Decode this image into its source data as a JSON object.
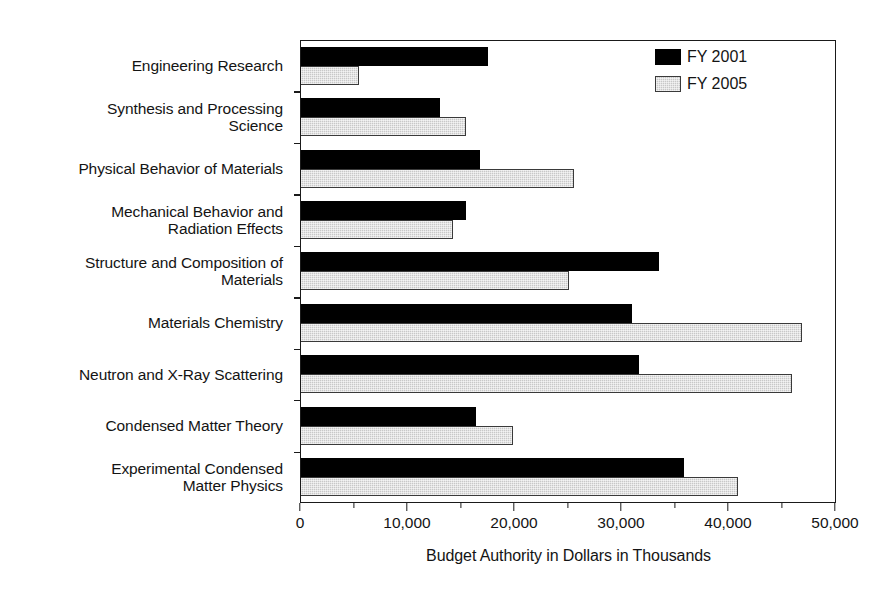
{
  "chart_data": {
    "type": "bar",
    "orientation": "horizontal",
    "title": "",
    "xlabel": "Budget Authority in Dollars in Thousands",
    "ylabel": "",
    "xlim": [
      0,
      50000
    ],
    "xticks": [
      0,
      10000,
      20000,
      30000,
      40000,
      50000
    ],
    "xticklabels": [
      "0",
      "10,000",
      "20,000",
      "30,000",
      "40,000",
      "50,000"
    ],
    "grid": false,
    "legend_position": "top-right",
    "categories": [
      "Engineering Research",
      "Synthesis and Processing Science",
      "Physical Behavior of Materials",
      "Mechanical Behavior and Radiation Effects",
      "Structure and Composition of Materials",
      "Materials Chemistry",
      "Neutron and X-Ray Scattering",
      "Condensed Matter Theory",
      "Experimental Condensed Matter Physics"
    ],
    "category_lines": [
      [
        "Engineering Research"
      ],
      [
        "Synthesis and Processing",
        "Science"
      ],
      [
        "Physical Behavior of Materials"
      ],
      [
        "Mechanical Behavior and",
        "Radiation Effects"
      ],
      [
        "Structure and Composition of",
        "Materials"
      ],
      [
        "Materials Chemistry"
      ],
      [
        "Neutron and X-Ray Scattering"
      ],
      [
        "Condensed Matter Theory"
      ],
      [
        "Experimental Condensed",
        "Matter Physics"
      ]
    ],
    "series": [
      {
        "name": "FY 2001",
        "color": "#000000",
        "values": [
          17500,
          13000,
          16700,
          15400,
          33500,
          30900,
          31600,
          16400,
          35800
        ]
      },
      {
        "name": "FY 2005",
        "color": "#c8c8c8",
        "values": [
          5400,
          15400,
          25500,
          14200,
          25000,
          46800,
          45900,
          19800,
          40800
        ]
      }
    ]
  }
}
